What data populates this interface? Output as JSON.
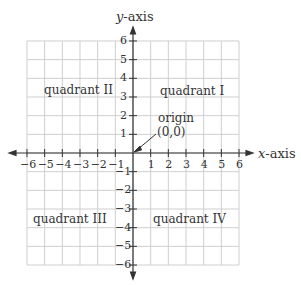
{
  "diagram": {
    "x_axis_label": "x-axis",
    "y_axis_label": "y-axis",
    "x_axis_italic": "x",
    "y_axis_italic": "y",
    "axis_suffix": "-axis",
    "x_ticks": [
      "−6",
      "−5",
      "−4",
      "−3",
      "−2",
      "−1",
      "1",
      "2",
      "3",
      "4",
      "5",
      "6"
    ],
    "y_ticks_pos": [
      "6",
      "5",
      "4",
      "3",
      "2",
      "1"
    ],
    "y_ticks_neg": [
      "−1",
      "−2",
      "−3",
      "−4",
      "−5",
      "−6"
    ],
    "quadrants": {
      "q1": "quadrant I",
      "q2": "quadrant II",
      "q3": "quadrant III",
      "q4": "quadrant IV"
    },
    "origin_label": "origin",
    "origin_coords": "(0,0)",
    "range": {
      "x": [
        -6,
        6
      ],
      "y": [
        -6,
        6
      ]
    },
    "colors": {
      "grid": "#c8c8c8",
      "axis": "#333333",
      "text": "#333333"
    }
  }
}
